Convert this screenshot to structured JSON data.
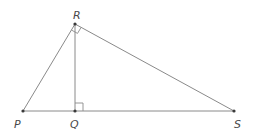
{
  "diagram": {
    "type": "geometry-right-triangle-with-altitude",
    "points": {
      "P": {
        "label": "P",
        "x": 23,
        "y": 111
      },
      "Q": {
        "label": "Q",
        "x": 75,
        "y": 111
      },
      "R": {
        "label": "R",
        "x": 75,
        "y": 24
      },
      "S": {
        "label": "S",
        "x": 234,
        "y": 111
      }
    },
    "segments": [
      "PR",
      "RS",
      "PS",
      "RQ"
    ],
    "right_angles": [
      "PRS",
      "RQS"
    ],
    "colors": {
      "line": "#8a8a8a",
      "point": "#3a3a3a",
      "label": "#4a4a4a"
    }
  }
}
